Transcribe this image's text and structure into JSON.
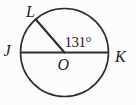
{
  "figure": {
    "type": "circle_with_central_angle",
    "background_color": "#fcfcfc",
    "stroke_color": "#2d2d2d",
    "center_point": "O",
    "diameter_endpoints": [
      "J",
      "K"
    ],
    "radius_endpoint": "L",
    "angle_deg": 131,
    "angle_label": "131°",
    "labels": {
      "L": "L",
      "J": "J",
      "K": "K",
      "O": "O"
    }
  }
}
